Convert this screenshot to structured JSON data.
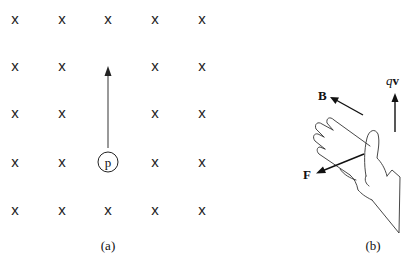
{
  "panel_a": {
    "caption": "(a)",
    "field_symbol": "x",
    "grid": {
      "rows": 5,
      "cols": 5,
      "x": [
        15,
        62,
        108,
        155,
        202
      ],
      "y": [
        19,
        66,
        113,
        162,
        210
      ]
    },
    "omitted_cells": [
      [
        1,
        2
      ],
      [
        2,
        2
      ],
      [
        3,
        2
      ]
    ],
    "particle": {
      "label": "p",
      "row": 3,
      "col": 2
    },
    "velocity_arrow": "up"
  },
  "panel_b": {
    "caption": "(b)",
    "labels": {
      "B": "B",
      "qv_q": "q",
      "qv_v": "v",
      "F": "F"
    }
  }
}
